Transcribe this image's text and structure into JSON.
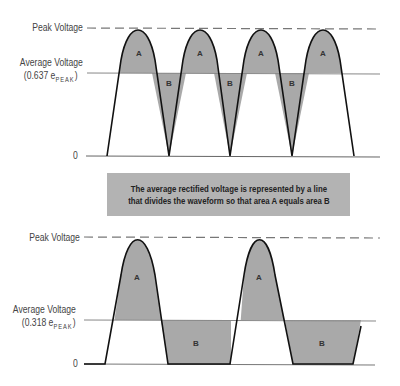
{
  "top_diagram": {
    "peak_label": "Peak Voltage",
    "average_label_line1": "Average Voltage",
    "average_label_prefix": "(0.637  e",
    "average_label_sub": "PEAK",
    "average_label_suffix": ")",
    "zero_label": "0",
    "area_labels": [
      "A",
      "B",
      "A",
      "B",
      "A",
      "B",
      "A"
    ],
    "waveform": "full-wave rectified",
    "average_factor": 0.637
  },
  "caption": {
    "line1": "The average rectified voltage is represented by a line",
    "line2": "that divides the waveform so that area A equals area B"
  },
  "bottom_diagram": {
    "peak_label": "Peak Voltage",
    "average_label_line1": "Average Voltage",
    "average_label_prefix": "(0.318  e",
    "average_label_sub": "PEAK",
    "average_label_suffix": ")",
    "zero_label": "0",
    "area_labels": [
      "A",
      "B",
      "A",
      "B"
    ],
    "waveform": "half-wave rectified",
    "average_factor": 0.318
  },
  "colors": {
    "fill": "#a9a9a9",
    "curve": "#111111",
    "line": "#888888",
    "caption_bg": "#b3b3b3"
  }
}
